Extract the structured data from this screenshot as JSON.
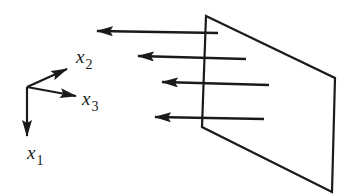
{
  "diagram": {
    "type": "wave-incident-on-plane",
    "colors": {
      "stroke": "#1a1a1a",
      "background": "#ffffff"
    },
    "axes": {
      "origin": [
        27,
        87
      ],
      "x1": {
        "label": "x",
        "subscript": "1",
        "direction": "down"
      },
      "x2": {
        "label": "x",
        "subscript": "2",
        "direction": "up-right"
      },
      "x3": {
        "label": "x",
        "subscript": "3",
        "direction": "right"
      }
    },
    "plane": {
      "vertices": [
        [
          206,
          16
        ],
        [
          335,
          78
        ],
        [
          332,
          192
        ],
        [
          202,
          127
        ]
      ]
    },
    "arrows": [
      {
        "from": [
          218,
          33
        ],
        "to": [
          97,
          31
        ]
      },
      {
        "from": [
          246,
          59
        ],
        "to": [
          138,
          56
        ]
      },
      {
        "from": [
          269,
          85
        ],
        "to": [
          162,
          82
        ]
      },
      {
        "from": [
          264,
          119
        ],
        "to": [
          155,
          117
        ]
      }
    ]
  }
}
